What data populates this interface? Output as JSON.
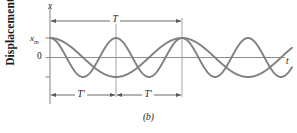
{
  "figure": {
    "caption": "(b)",
    "y_axis_title": "Displacement",
    "x_axis_symbol": "t",
    "y_axis_symbol": "x",
    "tick_labels": {
      "amplitude": "x",
      "amplitude_sub": "m",
      "zero": "0"
    },
    "annotations": {
      "period_full": "T",
      "period_half_left": "T′",
      "period_half_right": "T′"
    },
    "colors": {
      "curve": "#7f7f7f",
      "axis": "#808080",
      "text": "#1a1a1a",
      "background": "#ffffff"
    }
  },
  "chart_data": {
    "type": "line",
    "title": "",
    "subtitle": "(b)",
    "xlabel": "t",
    "ylabel": "Displacement",
    "grid": false,
    "legend_position": "none",
    "xlim": [
      0,
      2.0
    ],
    "ylim": [
      -1.25,
      1.25
    ],
    "x_tick_labels": [],
    "y_tick_labels": [
      "x_m",
      "0",
      "-x_m"
    ],
    "y_tick_values": [
      1,
      0,
      -1
    ],
    "annotations": [
      {
        "label": "T",
        "type": "double-arrow",
        "from_x": 0.0,
        "to_x": 1.0,
        "y": 1.22,
        "meaning": "period of slower oscillation"
      },
      {
        "label": "T'",
        "type": "double-arrow",
        "from_x": 0.0,
        "to_x": 0.5,
        "y": -1.2,
        "meaning": "period of faster oscillation"
      },
      {
        "label": "T'",
        "type": "double-arrow",
        "from_x": 0.5,
        "to_x": 1.0,
        "y": -1.2,
        "meaning": "period of faster oscillation"
      }
    ],
    "vertical_markers": [
      0.5,
      1.0
    ],
    "series": [
      {
        "name": "slower oscillation (period T)",
        "formula": "x = x_m cos(2*pi*t/T)",
        "period": 1.0,
        "amplitude": 1.0,
        "phase": 0,
        "x": [
          0,
          0.05,
          0.1,
          0.15,
          0.2,
          0.25,
          0.3,
          0.35,
          0.4,
          0.45,
          0.5,
          0.55,
          0.6,
          0.65,
          0.7,
          0.75,
          0.8,
          0.85,
          0.9,
          0.95,
          1.0,
          1.05,
          1.1,
          1.15,
          1.2,
          1.25,
          1.3,
          1.35,
          1.4,
          1.45,
          1.5,
          1.55,
          1.6,
          1.65,
          1.7,
          1.75,
          1.8,
          1.85,
          1.9,
          1.95,
          2.0
        ],
        "values": [
          1.0,
          0.951,
          0.809,
          0.588,
          0.309,
          0.0,
          -0.309,
          -0.588,
          -0.809,
          -0.951,
          -1.0,
          -0.951,
          -0.809,
          -0.588,
          -0.309,
          0.0,
          0.309,
          0.588,
          0.809,
          0.951,
          1.0,
          0.951,
          0.809,
          0.588,
          0.309,
          0.0,
          -0.309,
          -0.588,
          -0.809,
          -0.951,
          -1.0,
          -0.951,
          -0.809,
          -0.588,
          -0.309,
          0.0,
          0.309,
          0.588,
          0.809,
          0.951,
          1.0
        ]
      },
      {
        "name": "faster oscillation (period T')",
        "formula": "x = x_m cos(2*pi*t/T'), T' = T/2",
        "period": 0.5,
        "amplitude": 1.0,
        "phase": 0,
        "x": [
          0,
          0.05,
          0.1,
          0.15,
          0.2,
          0.25,
          0.3,
          0.35,
          0.4,
          0.45,
          0.5,
          0.55,
          0.6,
          0.65,
          0.7,
          0.75,
          0.8,
          0.85,
          0.9,
          0.95,
          1.0,
          1.05,
          1.1,
          1.15,
          1.2,
          1.25,
          1.3,
          1.35,
          1.4,
          1.45,
          1.5,
          1.55,
          1.6,
          1.65,
          1.7,
          1.75,
          1.8,
          1.85,
          1.9,
          1.95,
          2.0
        ],
        "values": [
          1.0,
          0.809,
          0.309,
          -0.309,
          -0.809,
          -1.0,
          -0.809,
          -0.309,
          0.309,
          0.809,
          1.0,
          0.809,
          0.309,
          -0.309,
          -0.809,
          -1.0,
          -0.809,
          -0.309,
          0.309,
          0.809,
          1.0,
          0.809,
          0.309,
          -0.309,
          -0.809,
          -1.0,
          -0.809,
          -0.309,
          0.309,
          0.809,
          1.0,
          0.809,
          0.309,
          -0.309,
          -0.809,
          -1.0,
          -0.809,
          -0.309,
          0.309,
          0.809,
          1.0
        ]
      }
    ]
  }
}
